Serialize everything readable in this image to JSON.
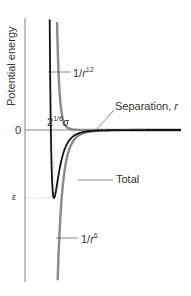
{
  "chart_data": {
    "type": "line",
    "ylabel": "Potential energy",
    "xlabel": "Separation, r",
    "y_ticks": [
      "0",
      "ε"
    ],
    "x_ticks": [
      "2^(1/6)σ"
    ],
    "annotations": {
      "zero_label": "0",
      "epsilon_label": "ε",
      "rmin_label_base": "2",
      "rmin_label_exp": "1/6",
      "rmin_label_sigma": "σ",
      "separation_label": "Separation, ",
      "separation_var": "r",
      "total_label": "Total",
      "r12_label_base": "1/",
      "r12_label_var": "r",
      "r12_label_exp": "12",
      "r6_label_base": "1/",
      "r6_label_var": "r",
      "r6_label_exp": "6"
    },
    "series": [
      {
        "name": "1/r^12",
        "style": "repulsive",
        "color": "#8a8a8a",
        "values": "+4ε(σ/r)^12"
      },
      {
        "name": "1/r^6",
        "style": "attractive",
        "color": "#8a8a8a",
        "values": "-4ε(σ/r)^6"
      },
      {
        "name": "Total",
        "style": "total",
        "color": "#111111",
        "values": "4ε[(σ/r)^12-(σ/r)^6]"
      }
    ],
    "minimum": {
      "x": "2^(1/6)σ",
      "y": "-ε"
    },
    "grid": false,
    "legend": "inline labels"
  },
  "colors": {
    "axis": "#666666",
    "total": "#111111",
    "component": "#8a8a8a",
    "guide": "#aaaaaa"
  }
}
